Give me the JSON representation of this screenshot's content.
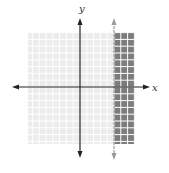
{
  "chart_data": {
    "type": "area",
    "title": "",
    "xlabel": "x",
    "ylabel": "y",
    "xlim": [
      -8,
      8
    ],
    "ylim": [
      -8,
      8
    ],
    "grid": true,
    "boundary": {
      "type": "vertical-line",
      "x": 5,
      "style": "dashed",
      "color": "#999999"
    },
    "shaded_region": {
      "inequality": "x >= 5",
      "color": "#7a7a7a"
    },
    "unshaded_color": "#eeeeee",
    "legend": null
  },
  "labels": {
    "x_axis": "x",
    "y_axis": "y"
  },
  "colors": {
    "axis": "#222222",
    "grid_line": "#ffffff",
    "light_fill": "#ececec",
    "dark_fill": "#7c7c7c",
    "boundary": "#9a9a9a"
  }
}
